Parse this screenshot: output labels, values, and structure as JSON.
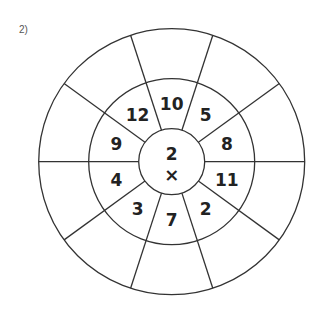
{
  "problem_label": "2)",
  "wheel": {
    "center_value": "2",
    "operator": "×",
    "inner_ring": [
      "10",
      "5",
      "8",
      "11",
      "2",
      "7",
      "3",
      "4",
      "9",
      "12"
    ],
    "outer_ring": [
      "",
      "",
      "",
      "",
      "",
      "",
      "",
      "",
      "",
      ""
    ]
  },
  "colors": {
    "line": "#333333",
    "text": "#222222"
  }
}
